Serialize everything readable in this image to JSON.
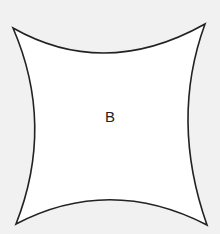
{
  "diagram": {
    "shape": "concave-square",
    "label": "B",
    "fill": "#ffffff",
    "stroke": "#222222",
    "background": "#f1f1f1"
  }
}
